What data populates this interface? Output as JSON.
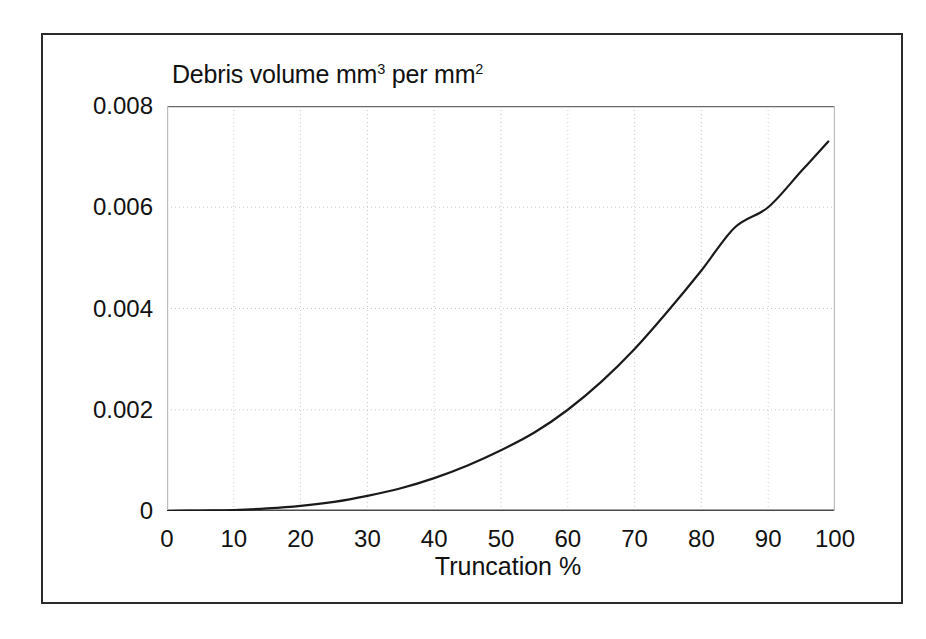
{
  "figure": {
    "title_text": "Debris volume mm",
    "title_sup": "3",
    "title_mid": " per mm",
    "title_sup2": "2",
    "title_full": "Debris volume mm3 per mm2",
    "frame_color": "#2b2b2b",
    "background": "#ffffff"
  },
  "chart_data": {
    "type": "line",
    "xlabel": "Truncation %",
    "ylabel": "Debris volume mm³ per mm²",
    "xlim": [
      0,
      100
    ],
    "ylim": [
      0,
      0.008
    ],
    "grid": true,
    "legend": "none",
    "line_color": "#1a1a1a",
    "line_width": 2.2,
    "x_ticks": [
      0,
      10,
      20,
      30,
      40,
      50,
      60,
      70,
      80,
      90,
      100
    ],
    "x_tick_labels": [
      "0",
      "10",
      "20",
      "30",
      "40",
      "50",
      "60",
      "70",
      "80",
      "90",
      "100"
    ],
    "y_ticks": [
      0,
      0.002,
      0.004,
      0.006,
      0.008
    ],
    "y_tick_labels": [
      "0",
      "0.002",
      "0.004",
      "0.006",
      "0.008"
    ],
    "series": [
      {
        "name": "Debris volume",
        "x": [
          0,
          5,
          10,
          15,
          20,
          25,
          30,
          35,
          40,
          45,
          50,
          55,
          60,
          65,
          70,
          75,
          80,
          85,
          90,
          95,
          99
        ],
        "values": [
          0.0,
          1e-05,
          2e-05,
          5e-05,
          0.0001,
          0.00018,
          0.0003,
          0.00045,
          0.00065,
          0.0009,
          0.0012,
          0.00155,
          0.002,
          0.00255,
          0.0032,
          0.00395,
          0.00475,
          0.0056,
          0.006,
          0.00672,
          0.0073
        ]
      }
    ]
  },
  "axes": {
    "y_labels": [
      "0.008",
      "0.006",
      "0.004",
      "0.002",
      "0"
    ],
    "x_labels": [
      "0",
      "10",
      "20",
      "30",
      "40",
      "50",
      "60",
      "70",
      "80",
      "90",
      "100"
    ],
    "x_title": "Truncation %"
  }
}
